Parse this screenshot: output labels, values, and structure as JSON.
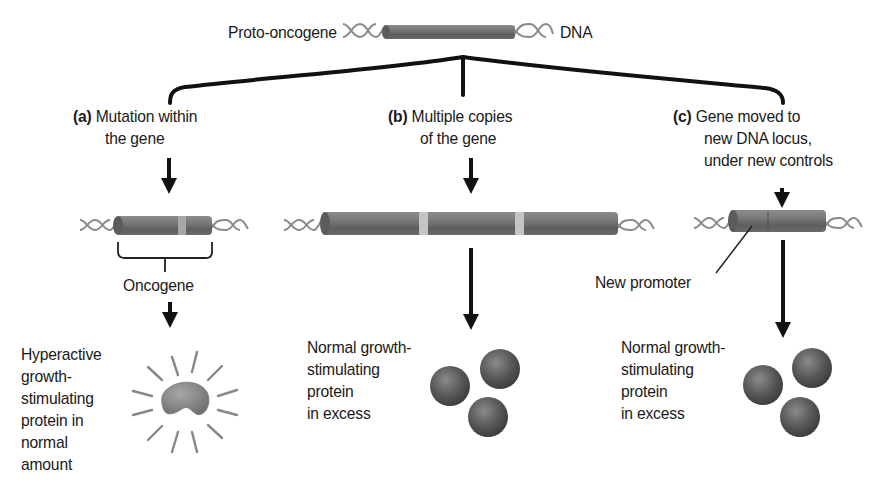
{
  "title_row": {
    "left_label": "Proto-oncogene",
    "right_label": "DNA"
  },
  "branches": [
    {
      "id": "a",
      "tag": "(a)",
      "heading_line1": "Mutation within",
      "heading_line2": "the gene",
      "gene_label": "Oncogene",
      "result_lines": [
        "Hyperactive",
        "growth-",
        "stimulating",
        "protein in",
        "normal",
        "amount"
      ]
    },
    {
      "id": "b",
      "tag": "(b)",
      "heading_line1": "Multiple copies",
      "heading_line2": "of the gene",
      "result_lines": [
        "Normal growth-",
        "stimulating",
        "protein",
        "in excess"
      ]
    },
    {
      "id": "c",
      "tag": "(c)",
      "heading_line1": "Gene moved to",
      "heading_line2": "new DNA locus,",
      "heading_line3": "under new controls",
      "promoter_label": "New promoter",
      "result_lines": [
        "Normal growth-",
        "stimulating",
        "protein",
        "in excess"
      ]
    }
  ],
  "colors": {
    "gene_cylinder": "#6e6e6e",
    "gene_highlight": "#9a9a9a",
    "band": "#c4c4c4",
    "dna_strand": "#8a8a8a",
    "protein_sphere": "#555555",
    "line": "#111111"
  }
}
